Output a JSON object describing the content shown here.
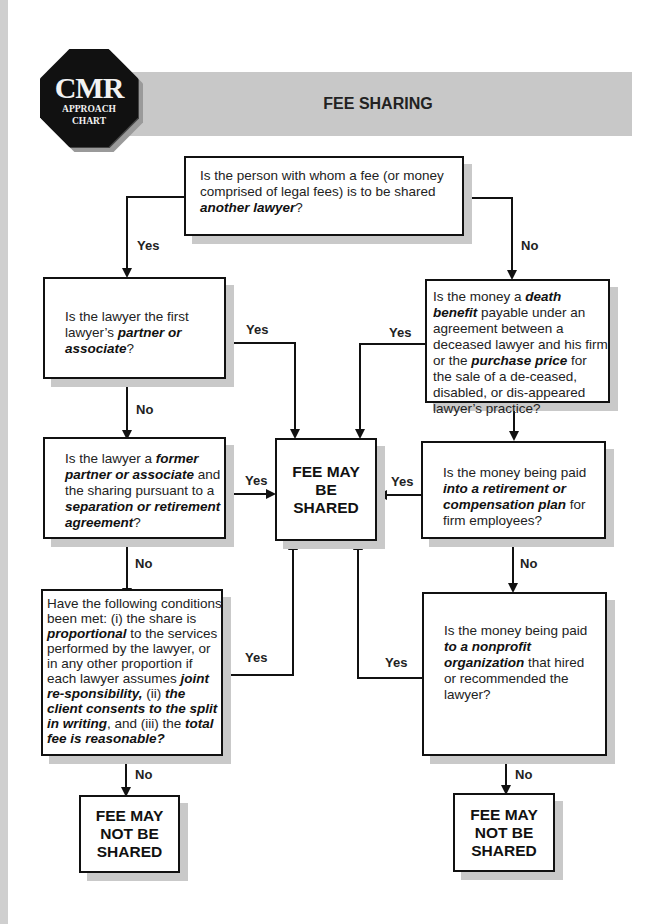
{
  "logo": {
    "main": "CMR",
    "line1": "APPROACH",
    "line2": "CHART"
  },
  "header": {
    "title": "FEE SHARING"
  },
  "nodes": {
    "q_lawyer": {
      "parts": [
        {
          "t": "Is the person with whom a fee (or money comprised of legal fees) is to be shared "
        },
        {
          "b": "another lawyer"
        },
        {
          "t": "?"
        }
      ]
    },
    "q_partner": {
      "parts": [
        {
          "t": "Is the lawyer the first lawyer’s "
        },
        {
          "b": "partner or associate"
        },
        {
          "t": "?"
        }
      ]
    },
    "q_former": {
      "parts": [
        {
          "t": "Is the lawyer a "
        },
        {
          "b": "former partner or associate"
        },
        {
          "t": " and the sharing pursuant to a "
        },
        {
          "b": "separation or retirement agreement"
        },
        {
          "t": "?"
        }
      ]
    },
    "q_conditions": {
      "parts": [
        {
          "t": "Have the following conditions been met: (i) the share is "
        },
        {
          "b": "proportional"
        },
        {
          "t": " to the services performed by the lawyer, or in any other proportion if each lawyer assumes "
        },
        {
          "b": "joint re-sponsibility,"
        },
        {
          "t": " (ii) "
        },
        {
          "b": "the client consents to the split in writing"
        },
        {
          "t": ", and (iii)  the "
        },
        {
          "b": "total fee is reasonable?"
        }
      ]
    },
    "q_death": {
      "parts": [
        {
          "t": "Is the money a "
        },
        {
          "b": "death benefit"
        },
        {
          "t": " payable under an agreement between a deceased lawyer and his firm or the "
        },
        {
          "b": "purchase price"
        },
        {
          "t": " for the sale of a de-ceased, disabled, or dis-appeared lawyer’s practice?"
        }
      ]
    },
    "q_retirement": {
      "parts": [
        {
          "t": "Is the money being paid "
        },
        {
          "b": "into a retirement or compensation plan"
        },
        {
          "t": " for firm employees?"
        }
      ]
    },
    "q_nonprofit": {
      "parts": [
        {
          "t": "Is the money being paid "
        },
        {
          "b": "to a nonprofit organization"
        },
        {
          "t": " that hired or recommended the lawyer?"
        }
      ]
    },
    "t_shared": {
      "line1": "FEE MAY",
      "line2": "BE",
      "line3": "SHARED"
    },
    "t_not_left": {
      "line1": "FEE MAY",
      "line2": "NOT BE",
      "line3": "SHARED"
    },
    "t_not_right": {
      "line1": "FEE MAY",
      "line2": "NOT BE",
      "line3": "SHARED"
    }
  },
  "edges": {
    "lawyer_yes": "Yes",
    "lawyer_no": "No",
    "partner_yes": "Yes",
    "partner_no": "No",
    "former_yes": "Yes",
    "former_no": "No",
    "conditions_yes": "Yes",
    "conditions_no": "No",
    "death_yes": "Yes",
    "death_no": "No",
    "retirement_yes": "Yes",
    "retirement_no": "No",
    "nonprofit_yes": "Yes",
    "nonprofit_no": "No"
  },
  "colors": {
    "line": "#111111",
    "shadow": "#c9c9c9",
    "header_band": "#c8c8c8",
    "logo_bg": "#111111"
  }
}
